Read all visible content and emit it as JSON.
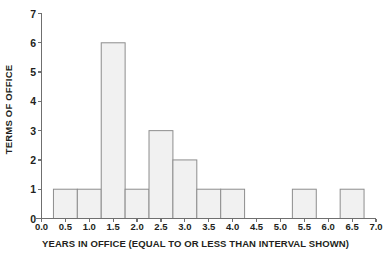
{
  "chart_data": {
    "type": "bar",
    "title": "",
    "subtitle": "",
    "xlabel": "YEARS IN OFFICE (EQUAL TO OR LESS THAN INTERVAL SHOWN)",
    "ylabel": "TERMS OF OFFICE",
    "xlim": [
      0.0,
      7.0
    ],
    "ylim": [
      0,
      7
    ],
    "grid": false,
    "legend": null,
    "bar_width": 0.5,
    "bar_align": "center",
    "xticks": [
      0.0,
      0.5,
      1.0,
      1.5,
      2.0,
      2.5,
      3.0,
      3.5,
      4.0,
      4.5,
      5.0,
      5.5,
      6.0,
      6.5,
      7.0
    ],
    "xtick_labels": [
      "0.0",
      "0.5",
      "1.0",
      "1.5",
      "2.0",
      "2.5",
      "3.0",
      "3.5",
      "4.0",
      "4.5",
      "5.0",
      "5.5",
      "6.0",
      "6.5",
      "7.0"
    ],
    "yticks": [
      0,
      1,
      2,
      3,
      4,
      5,
      6,
      7
    ],
    "ytick_labels": [
      "0",
      "1",
      "2",
      "3",
      "4",
      "5",
      "6",
      "7"
    ],
    "categories": [
      "0.5",
      "1.0",
      "1.5",
      "2.0",
      "2.5",
      "3.0",
      "3.5",
      "4.0",
      "4.5",
      "5.0",
      "5.5",
      "6.0",
      "6.5"
    ],
    "x": [
      0.5,
      1.0,
      1.5,
      2.0,
      2.5,
      3.0,
      3.5,
      4.0,
      4.5,
      5.0,
      5.5,
      6.0,
      6.5
    ],
    "values": [
      1,
      1,
      6,
      1,
      3,
      2,
      1,
      1,
      0,
      0,
      1,
      0,
      1
    ],
    "bar_fill": "#f1f1f1",
    "bar_edge": "#8d8d8d",
    "axis_color": "#6f6f6f",
    "text_color": "#231f20",
    "background": "#ffffff"
  }
}
